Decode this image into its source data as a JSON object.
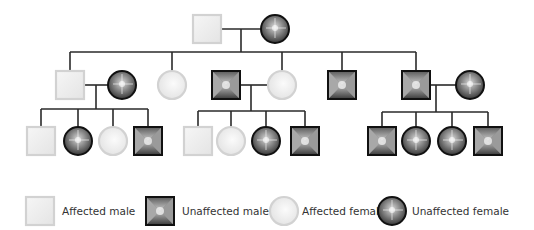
{
  "diagram": {
    "type": "pedigree-chart",
    "colors": {
      "affected_fill": "#ececec",
      "affected_border": "#d2d2d2",
      "unaffected_border": "#111111",
      "line": "#2a2a2a",
      "text": "#333333"
    },
    "generations": [
      {
        "label": "generation-1",
        "individuals": [
          {
            "id": "I-1",
            "sex": "male",
            "status": "affected",
            "cx": 207,
            "cy": 29
          },
          {
            "id": "I-2",
            "sex": "female",
            "status": "unaffected",
            "cx": 275,
            "cy": 29
          }
        ]
      },
      {
        "label": "generation-2",
        "individuals": [
          {
            "id": "II-1",
            "sex": "male",
            "status": "affected",
            "cx": 70,
            "cy": 85
          },
          {
            "id": "II-1-spouse",
            "sex": "female",
            "status": "unaffected",
            "cx": 122,
            "cy": 85
          },
          {
            "id": "II-2",
            "sex": "female",
            "status": "affected",
            "cx": 172,
            "cy": 85
          },
          {
            "id": "II-3-spouse",
            "sex": "male",
            "status": "unaffected",
            "cx": 226,
            "cy": 85
          },
          {
            "id": "II-3",
            "sex": "female",
            "status": "affected",
            "cx": 282,
            "cy": 85
          },
          {
            "id": "II-4",
            "sex": "male",
            "status": "unaffected",
            "cx": 342,
            "cy": 85
          },
          {
            "id": "II-5",
            "sex": "male",
            "status": "unaffected",
            "cx": 416,
            "cy": 85
          },
          {
            "id": "II-5-spouse",
            "sex": "female",
            "status": "unaffected",
            "cx": 470,
            "cy": 85
          }
        ]
      },
      {
        "label": "generation-3",
        "individuals": [
          {
            "id": "III-1",
            "sex": "male",
            "status": "affected",
            "cx": 41,
            "cy": 141
          },
          {
            "id": "III-2",
            "sex": "female",
            "status": "unaffected",
            "cx": 78,
            "cy": 141
          },
          {
            "id": "III-3",
            "sex": "female",
            "status": "affected",
            "cx": 113,
            "cy": 141
          },
          {
            "id": "III-4",
            "sex": "male",
            "status": "unaffected",
            "cx": 148,
            "cy": 141
          },
          {
            "id": "III-5",
            "sex": "male",
            "status": "affected",
            "cx": 198,
            "cy": 141
          },
          {
            "id": "III-6",
            "sex": "female",
            "status": "affected",
            "cx": 231,
            "cy": 141
          },
          {
            "id": "III-7",
            "sex": "female",
            "status": "unaffected",
            "cx": 266,
            "cy": 141
          },
          {
            "id": "III-8",
            "sex": "male",
            "status": "unaffected",
            "cx": 305,
            "cy": 141
          },
          {
            "id": "III-9",
            "sex": "male",
            "status": "unaffected",
            "cx": 382,
            "cy": 141
          },
          {
            "id": "III-10",
            "sex": "female",
            "status": "unaffected",
            "cx": 416,
            "cy": 141
          },
          {
            "id": "III-11",
            "sex": "female",
            "status": "unaffected",
            "cx": 452,
            "cy": 141
          },
          {
            "id": "III-12",
            "sex": "male",
            "status": "unaffected",
            "cx": 488,
            "cy": 141
          }
        ]
      }
    ],
    "lines": [
      {
        "x1": 222,
        "y1": 29,
        "x2": 261,
        "y2": 29
      },
      {
        "x1": 241,
        "y1": 29,
        "x2": 241,
        "y2": 52
      },
      {
        "x1": 70,
        "y1": 52,
        "x2": 416,
        "y2": 52
      },
      {
        "x1": 70,
        "y1": 52,
        "x2": 70,
        "y2": 71
      },
      {
        "x1": 172,
        "y1": 52,
        "x2": 172,
        "y2": 71
      },
      {
        "x1": 282,
        "y1": 52,
        "x2": 282,
        "y2": 71
      },
      {
        "x1": 342,
        "y1": 52,
        "x2": 342,
        "y2": 71
      },
      {
        "x1": 416,
        "y1": 52,
        "x2": 416,
        "y2": 71
      },
      {
        "x1": 84,
        "y1": 85,
        "x2": 108,
        "y2": 85
      },
      {
        "x1": 96,
        "y1": 85,
        "x2": 96,
        "y2": 109
      },
      {
        "x1": 41,
        "y1": 109,
        "x2": 148,
        "y2": 109
      },
      {
        "x1": 41,
        "y1": 109,
        "x2": 41,
        "y2": 127
      },
      {
        "x1": 78,
        "y1": 109,
        "x2": 78,
        "y2": 127
      },
      {
        "x1": 113,
        "y1": 109,
        "x2": 113,
        "y2": 127
      },
      {
        "x1": 148,
        "y1": 109,
        "x2": 148,
        "y2": 127
      },
      {
        "x1": 240,
        "y1": 85,
        "x2": 268,
        "y2": 85
      },
      {
        "x1": 251,
        "y1": 85,
        "x2": 251,
        "y2": 111
      },
      {
        "x1": 198,
        "y1": 111,
        "x2": 305,
        "y2": 111
      },
      {
        "x1": 198,
        "y1": 111,
        "x2": 198,
        "y2": 127
      },
      {
        "x1": 231,
        "y1": 111,
        "x2": 231,
        "y2": 127
      },
      {
        "x1": 266,
        "y1": 111,
        "x2": 266,
        "y2": 127
      },
      {
        "x1": 305,
        "y1": 111,
        "x2": 305,
        "y2": 127
      },
      {
        "x1": 430,
        "y1": 85,
        "x2": 456,
        "y2": 85
      },
      {
        "x1": 436,
        "y1": 85,
        "x2": 436,
        "y2": 112
      },
      {
        "x1": 382,
        "y1": 112,
        "x2": 488,
        "y2": 112
      },
      {
        "x1": 382,
        "y1": 112,
        "x2": 382,
        "y2": 127
      },
      {
        "x1": 416,
        "y1": 112,
        "x2": 416,
        "y2": 127
      },
      {
        "x1": 452,
        "y1": 112,
        "x2": 452,
        "y2": 127
      },
      {
        "x1": 488,
        "y1": 112,
        "x2": 488,
        "y2": 127
      }
    ]
  },
  "legend": {
    "items": [
      {
        "symbol": "affected-male",
        "label": "Affected male"
      },
      {
        "symbol": "unaffected-male",
        "label": "Unaffected male"
      },
      {
        "symbol": "affected-female",
        "label": "Affected female"
      },
      {
        "symbol": "unaffected-female",
        "label": "Unaffected female"
      }
    ]
  }
}
